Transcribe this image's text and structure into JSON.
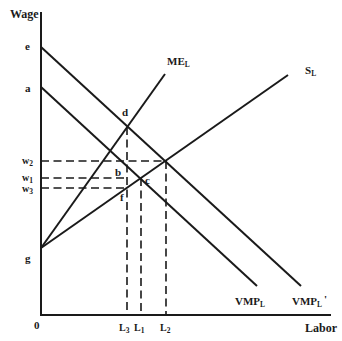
{
  "axes": {
    "y_label": "Wage",
    "x_label": "Labor",
    "origin_label": "0",
    "y_axis": [
      41,
      13,
      41,
      315
    ],
    "x_axis": [
      41,
      315,
      330,
      315
    ]
  },
  "intercepts": {
    "e": "e",
    "a": "a",
    "g": "g"
  },
  "curves": {
    "vmp_prime": {
      "base": "VMP",
      "sub": "L",
      "suffix": "'",
      "line": [
        41,
        47,
        301,
        286
      ]
    },
    "vmp": {
      "base": "VMP",
      "sub": "L",
      "suffix": "",
      "line": [
        41,
        87,
        257,
        286
      ]
    },
    "me": {
      "base": "ME",
      "sub": "L",
      "line": [
        41,
        248,
        165,
        74
      ]
    },
    "supply": {
      "base": "S",
      "sub": "L",
      "line": [
        41,
        248,
        288,
        75
      ]
    }
  },
  "wages": [
    {
      "base": "w",
      "sub": "2",
      "line": [
        41,
        161,
        166,
        161
      ]
    },
    {
      "base": "w",
      "sub": "1",
      "line": [
        41,
        178,
        127,
        178
      ]
    },
    {
      "base": "w",
      "sub": "3",
      "line": [
        41,
        188,
        127,
        188
      ]
    }
  ],
  "quantities": [
    {
      "base": "L",
      "sub": "3",
      "line": [
        127,
        127,
        127,
        315
      ]
    },
    {
      "base": "L",
      "sub": "1",
      "line": [
        141,
        178,
        141,
        315
      ]
    },
    {
      "base": "L",
      "sub": "2",
      "line": [
        166,
        161,
        166,
        315
      ]
    }
  ],
  "points": {
    "d": "d",
    "b": "b",
    "c": "c",
    "f": "f"
  },
  "diagram_data": {
    "type": "line",
    "title": "",
    "xlabel": "Labor",
    "ylabel": "Wage",
    "series": [
      {
        "name": "VMP_L'",
        "intercept": "e",
        "slope": "negative"
      },
      {
        "name": "VMP_L",
        "intercept": "a",
        "slope": "negative"
      },
      {
        "name": "ME_L",
        "intercept": "g",
        "slope": "positive, steep"
      },
      {
        "name": "S_L",
        "intercept": "g",
        "slope": "positive"
      }
    ],
    "marked_points": [
      "d",
      "b",
      "c",
      "f"
    ],
    "wage_levels": [
      "w2",
      "w1",
      "w3"
    ],
    "labor_levels": [
      "L3",
      "L1",
      "L2"
    ],
    "grid": false
  }
}
